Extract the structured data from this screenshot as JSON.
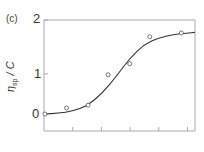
{
  "panel_label": "(c)",
  "chart_data": {
    "type": "scatter",
    "title": "",
    "xlabel": "",
    "ylabel": "ηsp / C",
    "ylabel_main": "η",
    "ylabel_sub": "sp",
    "ylabel_rest": " / C",
    "yticks": [
      0,
      1,
      2
    ],
    "ytick_labels": [
      "0",
      "1",
      "2"
    ],
    "ylim": [
      0,
      2
    ],
    "xticks_count": 5,
    "xtick_labels": [],
    "grid": false,
    "legend": null,
    "series": [
      {
        "name": "measured",
        "marker": "open-circle",
        "x": [
          0.0,
          0.75,
          1.5,
          2.2,
          2.95,
          3.65,
          4.75
        ],
        "y": [
          0.0,
          0.15,
          0.22,
          0.98,
          1.19,
          1.69,
          1.76
        ]
      },
      {
        "name": "fit",
        "style": "line",
        "x": [
          0.0,
          0.5,
          1.0,
          1.5,
          2.0,
          2.5,
          3.0,
          3.5,
          4.0,
          4.5,
          5.0,
          5.3
        ],
        "y": [
          0.0,
          0.02,
          0.07,
          0.2,
          0.5,
          0.92,
          1.3,
          1.55,
          1.67,
          1.73,
          1.76,
          1.77
        ]
      }
    ],
    "colors": {
      "axis": "#aaaaaa",
      "line": "#333333",
      "marker": "#555555"
    }
  }
}
